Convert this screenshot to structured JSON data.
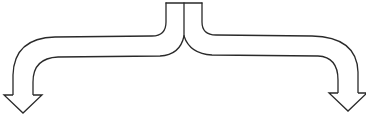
{
  "diagram": {
    "type": "split-arrow",
    "colors": {
      "stroke": "#2a2a2a",
      "fill": "#ffffff",
      "background": "#ffffff"
    },
    "stem": {
      "x_left": 166,
      "x_right": 202,
      "x_divider": 184,
      "y_top": 3
    },
    "branches": [
      {
        "name": "left",
        "direction": "down",
        "tip": [
          23,
          113
        ]
      },
      {
        "name": "right",
        "direction": "down",
        "tip": [
          348,
          111
        ]
      }
    ]
  }
}
